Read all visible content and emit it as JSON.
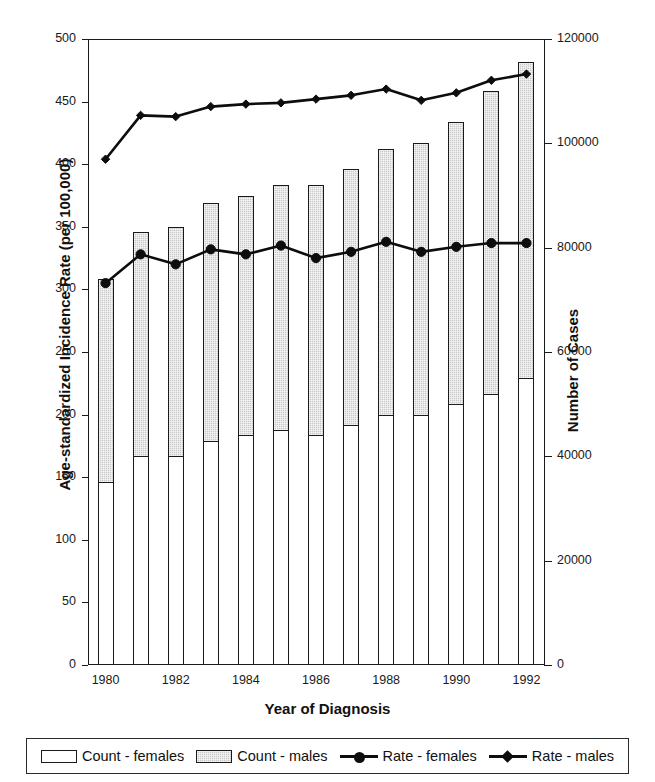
{
  "chart_data": {
    "type": "bar",
    "title": "",
    "xlabel": "Year of Diagnosis",
    "ylabel": "Age-standardized Incidence Rate (per 100,000)",
    "ylabel_right": "Number of Cases",
    "categories": [
      1980,
      1981,
      1982,
      1983,
      1984,
      1985,
      1986,
      1987,
      1988,
      1989,
      1990,
      1991,
      1992
    ],
    "xticks": [
      "1980",
      "1982",
      "1984",
      "1986",
      "1988",
      "1990",
      "1992"
    ],
    "yticks_left": [
      "0",
      "50",
      "100",
      "150",
      "200",
      "250",
      "300",
      "350",
      "400",
      "450",
      "500"
    ],
    "yticks_right": [
      "0",
      "20000",
      "40000",
      "60000",
      "80000",
      "100000",
      "120000"
    ],
    "ylim_left": [
      0,
      500
    ],
    "ylim_right": [
      0,
      120000
    ],
    "grid": false,
    "legend_position": "bottom",
    "series": [
      {
        "name": "Count - females",
        "kind": "bar-stack",
        "axis": "right",
        "values": [
          35000,
          40000,
          40000,
          43000,
          44000,
          45000,
          44000,
          46000,
          48000,
          48000,
          50000,
          52000,
          55000
        ]
      },
      {
        "name": "Count - males",
        "kind": "bar-stack",
        "axis": "right",
        "values": [
          39000,
          43000,
          44000,
          45500,
          46000,
          47000,
          48000,
          49000,
          51000,
          52000,
          54000,
          58000,
          60500
        ]
      },
      {
        "name": "Rate - females",
        "kind": "line",
        "axis": "left",
        "marker": "circle",
        "values": [
          305,
          328,
          320,
          332,
          328,
          335,
          325,
          330,
          338,
          330,
          334,
          337,
          337
        ]
      },
      {
        "name": "Rate - males",
        "kind": "line",
        "axis": "left",
        "marker": "diamond",
        "values": [
          404,
          439,
          438,
          446,
          448,
          449,
          452,
          455,
          460,
          451,
          457,
          467,
          472
        ]
      }
    ],
    "bar_totals_right_axis": [
      74000,
      83000,
      84000,
      88500,
      90000,
      92000,
      92000,
      95000,
      99000,
      100000,
      104000,
      110000,
      115500
    ]
  },
  "legend": {
    "items": [
      {
        "label": "Count - females",
        "swatch": "white-box"
      },
      {
        "label": "Count - males",
        "swatch": "gray-box"
      },
      {
        "label": "Rate - females",
        "swatch": "line-circle"
      },
      {
        "label": "Rate - males",
        "swatch": "line-diamond"
      }
    ]
  },
  "colors": {
    "axis": "#1a1a1a",
    "line": "#0d0d0d",
    "bar_female": "#ffffff",
    "bar_male": "#c9c9c9"
  }
}
